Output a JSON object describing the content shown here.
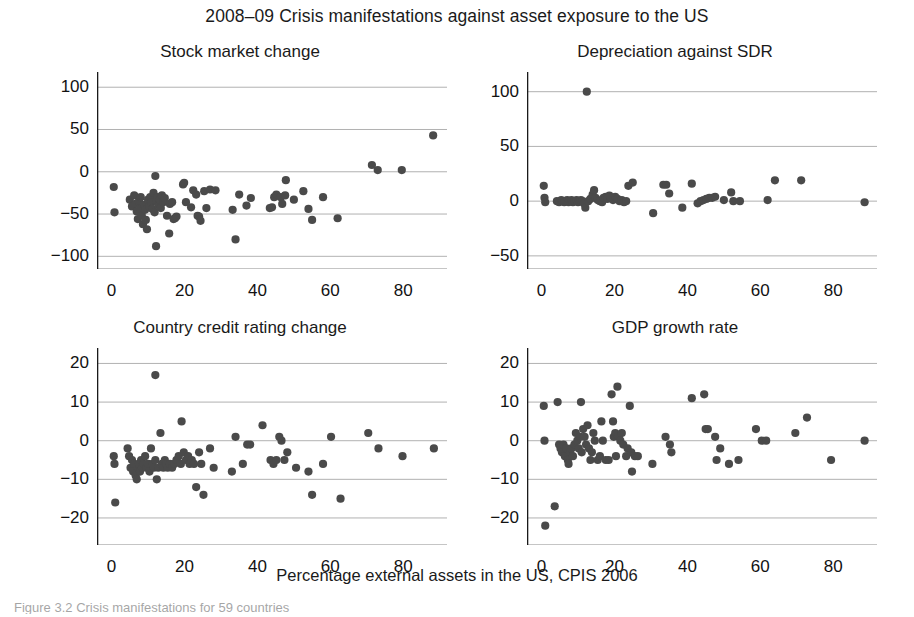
{
  "figure": {
    "title": "2008–09 Crisis manifestations against asset exposure to the US",
    "xlabel": "Percentage external assets in the US, CPIS 2006",
    "caption_partial": "Figure 3.2 Crisis manifestations for 59 countries",
    "marker_color": "#4a4a4a",
    "axis_color": "#1a1a1a",
    "grid_color": "#a8a8a8"
  },
  "chart_data": [
    {
      "type": "scatter",
      "title": "Stock market change",
      "xlabel": "Percentage external assets in the US, CPIS 2006",
      "ylabel": "",
      "xlim": [
        -4,
        92
      ],
      "ylim": [
        -115,
        118
      ],
      "xticks": [
        0,
        20,
        40,
        60,
        80
      ],
      "yticks": [
        100,
        50,
        0,
        -50,
        -100
      ],
      "grid": true,
      "points": [
        [
          0.6,
          -18
        ],
        [
          0.8,
          -48
        ],
        [
          5.0,
          -33
        ],
        [
          5.6,
          -41
        ],
        [
          6.2,
          -28
        ],
        [
          6.6,
          -38
        ],
        [
          6.9,
          -47
        ],
        [
          7.2,
          -56
        ],
        [
          7.5,
          -35
        ],
        [
          7.8,
          -44
        ],
        [
          8.0,
          -30
        ],
        [
          8.3,
          -52
        ],
        [
          8.6,
          -62
        ],
        [
          8.9,
          -39
        ],
        [
          9.2,
          -45
        ],
        [
          9.4,
          -57
        ],
        [
          9.7,
          -68
        ],
        [
          10.0,
          -33
        ],
        [
          10.3,
          -41
        ],
        [
          10.6,
          -30
        ],
        [
          10.9,
          -36
        ],
        [
          11.2,
          -44
        ],
        [
          11.5,
          -25
        ],
        [
          11.8,
          -48
        ],
        [
          12.0,
          -5
        ],
        [
          12.3,
          -35
        ],
        [
          12.6,
          -30
        ],
        [
          12.9,
          -40
        ],
        [
          13.2,
          -33
        ],
        [
          13.5,
          -43
        ],
        [
          13.8,
          -28
        ],
        [
          12.2,
          -88
        ],
        [
          14.2,
          -36
        ],
        [
          14.6,
          -31
        ],
        [
          15.2,
          -52
        ],
        [
          16.0,
          -38
        ],
        [
          16.6,
          -36
        ],
        [
          17.0,
          -56
        ],
        [
          17.4,
          -55
        ],
        [
          17.8,
          -53
        ],
        [
          15.8,
          -73
        ],
        [
          19.6,
          -15
        ],
        [
          19.9,
          -13
        ],
        [
          20.4,
          -36
        ],
        [
          21.8,
          -42
        ],
        [
          22.4,
          -22
        ],
        [
          23.2,
          -27
        ],
        [
          23.6,
          -52
        ],
        [
          24.0,
          -53
        ],
        [
          24.4,
          -58
        ],
        [
          25.4,
          -23
        ],
        [
          26.0,
          -43
        ],
        [
          27.0,
          -21
        ],
        [
          28.5,
          -22
        ],
        [
          33.2,
          -45
        ],
        [
          34.0,
          -80
        ],
        [
          35.0,
          -27
        ],
        [
          37.0,
          -40
        ],
        [
          38.2,
          -31
        ],
        [
          43.4,
          -43
        ],
        [
          44.0,
          -42
        ],
        [
          44.6,
          -30
        ],
        [
          45.2,
          -27
        ],
        [
          46.4,
          -30
        ],
        [
          46.8,
          -38
        ],
        [
          47.6,
          -28
        ],
        [
          47.8,
          -10
        ],
        [
          50.0,
          -33
        ],
        [
          52.6,
          -23
        ],
        [
          54.0,
          -44
        ],
        [
          55.0,
          -57
        ],
        [
          58.0,
          -30
        ],
        [
          62.0,
          -55
        ],
        [
          71.4,
          8
        ],
        [
          73.0,
          2
        ],
        [
          79.6,
          2
        ],
        [
          88.2,
          43
        ]
      ]
    },
    {
      "type": "scatter",
      "title": "Depreciation against SDR",
      "xlabel": "Percentage external assets in the US, CPIS 2006",
      "ylabel": "",
      "xlim": [
        -4,
        92
      ],
      "ylim": [
        -62,
        118
      ],
      "xticks": [
        0,
        20,
        40,
        60,
        80
      ],
      "yticks": [
        100,
        50,
        0,
        -50
      ],
      "grid": true,
      "points": [
        [
          0.6,
          14
        ],
        [
          0.8,
          3
        ],
        [
          1.0,
          -1
        ],
        [
          4.2,
          0
        ],
        [
          4.8,
          -1
        ],
        [
          5.4,
          1
        ],
        [
          5.8,
          0
        ],
        [
          6.2,
          -1
        ],
        [
          6.6,
          0
        ],
        [
          7.0,
          1
        ],
        [
          7.4,
          -1
        ],
        [
          7.8,
          0
        ],
        [
          8.2,
          1
        ],
        [
          8.6,
          -1
        ],
        [
          9.0,
          0
        ],
        [
          9.6,
          1
        ],
        [
          10.0,
          -1
        ],
        [
          10.4,
          0
        ],
        [
          10.8,
          1
        ],
        [
          11.2,
          0
        ],
        [
          11.6,
          -2
        ],
        [
          12.0,
          -6
        ],
        [
          12.4,
          100
        ],
        [
          12.8,
          0
        ],
        [
          13.4,
          2
        ],
        [
          14.0,
          6
        ],
        [
          14.4,
          10
        ],
        [
          14.8,
          3
        ],
        [
          15.4,
          1
        ],
        [
          16.0,
          0
        ],
        [
          16.6,
          -1
        ],
        [
          17.0,
          3
        ],
        [
          17.6,
          4
        ],
        [
          18.0,
          2
        ],
        [
          18.6,
          5
        ],
        [
          19.0,
          3
        ],
        [
          19.6,
          1
        ],
        [
          20.2,
          4
        ],
        [
          20.8,
          2
        ],
        [
          21.4,
          0
        ],
        [
          22.0,
          1
        ],
        [
          22.6,
          -1
        ],
        [
          23.2,
          0
        ],
        [
          23.8,
          14
        ],
        [
          25.0,
          17
        ],
        [
          30.6,
          -11
        ],
        [
          33.4,
          15
        ],
        [
          34.2,
          15
        ],
        [
          35.0,
          7
        ],
        [
          38.6,
          -6
        ],
        [
          41.2,
          16
        ],
        [
          42.8,
          -2
        ],
        [
          43.6,
          0
        ],
        [
          44.4,
          1
        ],
        [
          45.2,
          2
        ],
        [
          46.0,
          3
        ],
        [
          46.8,
          3
        ],
        [
          47.6,
          4
        ],
        [
          50.0,
          1
        ],
        [
          52.0,
          8
        ],
        [
          52.6,
          0
        ],
        [
          54.4,
          0
        ],
        [
          62.0,
          1
        ],
        [
          64.0,
          19
        ],
        [
          71.2,
          19
        ],
        [
          88.6,
          -1
        ]
      ]
    },
    {
      "type": "scatter",
      "title": "Country credit rating change",
      "xlabel": "Percentage external assets in the US, CPIS 2006",
      "ylabel": "",
      "xlim": [
        -4,
        92
      ],
      "ylim": [
        -27,
        24
      ],
      "xticks": [
        0,
        20,
        40,
        60,
        80
      ],
      "yticks": [
        20,
        10,
        0,
        -10,
        -20
      ],
      "grid": true,
      "points": [
        [
          0.6,
          -4
        ],
        [
          0.8,
          -6
        ],
        [
          1.0,
          -16
        ],
        [
          4.4,
          -2
        ],
        [
          4.8,
          -4
        ],
        [
          5.2,
          -7
        ],
        [
          5.6,
          -5
        ],
        [
          5.9,
          -8
        ],
        [
          6.2,
          -6
        ],
        [
          6.6,
          -9
        ],
        [
          6.9,
          -10
        ],
        [
          7.2,
          -7
        ],
        [
          7.5,
          -6
        ],
        [
          7.8,
          -8
        ],
        [
          8.1,
          -5
        ],
        [
          8.4,
          -7
        ],
        [
          8.8,
          -6
        ],
        [
          9.2,
          -4
        ],
        [
          9.6,
          -7
        ],
        [
          10.0,
          -6
        ],
        [
          10.4,
          -8
        ],
        [
          10.8,
          -2
        ],
        [
          11.2,
          -6
        ],
        [
          11.6,
          -7
        ],
        [
          12.0,
          -5
        ],
        [
          12.4,
          -10
        ],
        [
          12.0,
          17
        ],
        [
          12.8,
          -7
        ],
        [
          13.4,
          2
        ],
        [
          13.8,
          -6
        ],
        [
          14.2,
          -7
        ],
        [
          14.6,
          -5
        ],
        [
          15.0,
          -6
        ],
        [
          15.4,
          -7
        ],
        [
          16.0,
          -6
        ],
        [
          16.6,
          -7
        ],
        [
          17.2,
          -6
        ],
        [
          17.8,
          -5
        ],
        [
          18.4,
          -4
        ],
        [
          19.0,
          -6
        ],
        [
          19.2,
          5
        ],
        [
          19.8,
          -3
        ],
        [
          20.4,
          -5
        ],
        [
          21.0,
          -4
        ],
        [
          21.4,
          -6
        ],
        [
          22.0,
          -5
        ],
        [
          22.6,
          -6
        ],
        [
          23.2,
          -12
        ],
        [
          24.0,
          -3
        ],
        [
          24.6,
          -6
        ],
        [
          25.2,
          -14
        ],
        [
          27.0,
          -2
        ],
        [
          28.0,
          -7
        ],
        [
          33.0,
          -8
        ],
        [
          34.0,
          1
        ],
        [
          36.0,
          -6
        ],
        [
          37.2,
          -1
        ],
        [
          38.0,
          -1
        ],
        [
          41.4,
          4
        ],
        [
          43.6,
          -5
        ],
        [
          44.4,
          -6
        ],
        [
          45.2,
          -5
        ],
        [
          46.0,
          1
        ],
        [
          46.6,
          0
        ],
        [
          47.4,
          -5
        ],
        [
          48.2,
          -3
        ],
        [
          50.6,
          -7
        ],
        [
          54.0,
          -8
        ],
        [
          55.0,
          -14
        ],
        [
          58.0,
          -6
        ],
        [
          60.2,
          1
        ],
        [
          62.8,
          -15
        ],
        [
          70.4,
          2
        ],
        [
          73.2,
          -2
        ],
        [
          79.8,
          -4
        ],
        [
          88.4,
          -2
        ]
      ]
    },
    {
      "type": "scatter",
      "title": "GDP growth rate",
      "xlabel": "Percentage external assets in the US, CPIS 2006",
      "ylabel": "",
      "xlim": [
        -4,
        92
      ],
      "ylim": [
        -27,
        24
      ],
      "xticks": [
        0,
        20,
        40,
        60,
        80
      ],
      "yticks": [
        20,
        10,
        0,
        -10,
        -20
      ],
      "grid": true,
      "points": [
        [
          0.6,
          9
        ],
        [
          0.8,
          0
        ],
        [
          1.0,
          -22
        ],
        [
          3.6,
          -17
        ],
        [
          4.4,
          10
        ],
        [
          4.8,
          -1
        ],
        [
          5.2,
          -2
        ],
        [
          5.6,
          -3
        ],
        [
          6.0,
          -1
        ],
        [
          6.4,
          -4
        ],
        [
          6.8,
          -2
        ],
        [
          7.2,
          -5
        ],
        [
          7.4,
          -6
        ],
        [
          7.8,
          -3
        ],
        [
          8.2,
          -2
        ],
        [
          8.6,
          -4
        ],
        [
          9.0,
          -1
        ],
        [
          9.4,
          2
        ],
        [
          9.8,
          0
        ],
        [
          10.2,
          -2
        ],
        [
          10.6,
          1
        ],
        [
          10.8,
          10
        ],
        [
          11.0,
          -3
        ],
        [
          11.4,
          3
        ],
        [
          11.8,
          1
        ],
        [
          12.2,
          -1
        ],
        [
          12.6,
          4
        ],
        [
          13.0,
          -2
        ],
        [
          13.4,
          -5
        ],
        [
          13.8,
          -3
        ],
        [
          14.2,
          2
        ],
        [
          14.6,
          0
        ],
        [
          15.4,
          -5
        ],
        [
          16.0,
          -4
        ],
        [
          16.4,
          5
        ],
        [
          16.8,
          0
        ],
        [
          17.6,
          -5
        ],
        [
          18.4,
          -5
        ],
        [
          19.2,
          12
        ],
        [
          19.6,
          5
        ],
        [
          19.8,
          1
        ],
        [
          20.2,
          2
        ],
        [
          20.4,
          -4
        ],
        [
          20.8,
          14
        ],
        [
          21.2,
          1
        ],
        [
          21.6,
          0
        ],
        [
          22.0,
          2
        ],
        [
          22.4,
          -1
        ],
        [
          23.2,
          -4
        ],
        [
          23.6,
          -2
        ],
        [
          24.2,
          9
        ],
        [
          24.6,
          -3
        ],
        [
          24.8,
          -8
        ],
        [
          25.6,
          -4
        ],
        [
          26.4,
          -4
        ],
        [
          30.4,
          -6
        ],
        [
          34.0,
          1
        ],
        [
          35.2,
          -1
        ],
        [
          35.6,
          -3
        ],
        [
          41.2,
          11
        ],
        [
          44.6,
          12
        ],
        [
          45.0,
          3
        ],
        [
          45.6,
          3
        ],
        [
          47.6,
          1
        ],
        [
          48.0,
          -5
        ],
        [
          49.0,
          -2
        ],
        [
          51.4,
          -6
        ],
        [
          54.0,
          -5
        ],
        [
          58.8,
          3
        ],
        [
          60.4,
          0
        ],
        [
          61.6,
          0
        ],
        [
          69.6,
          2
        ],
        [
          72.8,
          6
        ],
        [
          79.4,
          -5
        ],
        [
          88.6,
          0
        ]
      ]
    }
  ]
}
